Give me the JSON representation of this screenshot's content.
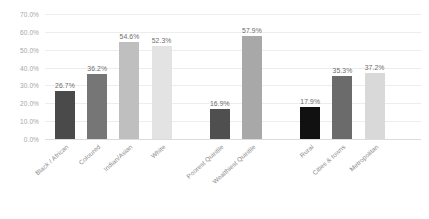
{
  "chart_data": {
    "type": "bar",
    "title": "",
    "subtitle": "",
    "xlabel": "",
    "ylabel": "",
    "ylim": [
      0,
      70
    ],
    "grid": true,
    "legend": "none",
    "value_suffix": "%",
    "categories": [
      "Black / African",
      "Coloured",
      "Indian/Asian",
      "White",
      "Poorest Quintile",
      "Wealthiest Quintile",
      "Rural",
      "Cities & towns",
      "Metropolitan"
    ],
    "values": [
      26.7,
      36.2,
      54.6,
      52.3,
      16.9,
      57.9,
      17.9,
      35.3,
      37.2
    ],
    "value_labels": [
      "26.7%",
      "36.2%",
      "54.6%",
      "52.3%",
      "16.9%",
      "57.9%",
      "17.9%",
      "35.3%",
      "37.2%"
    ],
    "bar_colors": [
      "#4a4a4a",
      "#767676",
      "#bfbfbf",
      "#e3e3e3",
      "#4f4f4f",
      "#a8a8a8",
      "#111111",
      "#6b6b6b",
      "#d9d9d9"
    ],
    "groups": [
      {
        "name": "Population group",
        "category_indices": [
          0,
          1,
          2,
          3
        ]
      },
      {
        "name": "Wealth quintile",
        "category_indices": [
          4,
          5
        ]
      },
      {
        "name": "Settlement type",
        "category_indices": [
          6,
          7,
          8
        ]
      }
    ],
    "ytick_labels": [
      "0.0%",
      "10.0%",
      "20.0%",
      "30.0%",
      "40.0%",
      "50.0%",
      "60.0%",
      "70.0%"
    ],
    "ytick_values": [
      0,
      10,
      20,
      30,
      40,
      50,
      60,
      70
    ],
    "colors": {
      "background": "#ffffff",
      "gridline": "#ededed",
      "baseline": "#dcdcdc",
      "axis_text": "#a6a6a6",
      "category_text": "#8c8c8c",
      "value_text": "#6d6d6d"
    }
  }
}
